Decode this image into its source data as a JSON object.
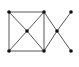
{
  "graph": {
    "nodes": [
      {
        "id": "A",
        "x": 9,
        "y": 12
      },
      {
        "id": "B",
        "x": 44,
        "y": 12
      },
      {
        "id": "C",
        "x": 27,
        "y": 31
      },
      {
        "id": "D",
        "x": 9,
        "y": 51
      },
      {
        "id": "E",
        "x": 44,
        "y": 51
      },
      {
        "id": "F",
        "x": 57,
        "y": 31
      },
      {
        "id": "G",
        "x": 71,
        "y": 12
      },
      {
        "id": "H",
        "x": 71,
        "y": 51
      }
    ],
    "edges": [
      [
        "A",
        "B"
      ],
      [
        "A",
        "D"
      ],
      [
        "B",
        "E"
      ],
      [
        "D",
        "E"
      ],
      [
        "A",
        "C"
      ],
      [
        "B",
        "C"
      ],
      [
        "D",
        "C"
      ],
      [
        "E",
        "C"
      ],
      [
        "B",
        "F"
      ],
      [
        "E",
        "F"
      ],
      [
        "F",
        "G"
      ],
      [
        "F",
        "H"
      ]
    ],
    "edge_color": "#444444",
    "node_color": "#111111"
  }
}
